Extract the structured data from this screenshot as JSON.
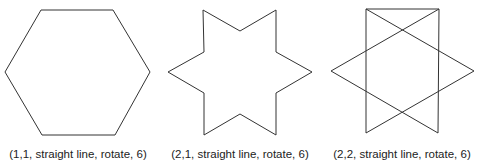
{
  "panels": [
    {
      "caption": "(1,1, straight line, rotate, 6)",
      "shape": "hexagon",
      "points": "41,10 113,10 150,72 115,135 42,135 5,72"
    },
    {
      "caption": "(2,1, straight line, rotate, 6)",
      "shape": "six-point-star-outline",
      "points": "203,10 240,31 276,10 276,52 312,72 276,93 276,135 240,114 204,135 204,93 168,72 204,52"
    },
    {
      "caption": "(2,2, straight line, rotate, 6)",
      "shape": "hexagram-crossing-lines",
      "points": "366,9 474,71 366,133 366,9 439,9 331,71 438,133 439,9"
    }
  ],
  "colors": {
    "stroke": "#333333",
    "text": "#222222"
  }
}
